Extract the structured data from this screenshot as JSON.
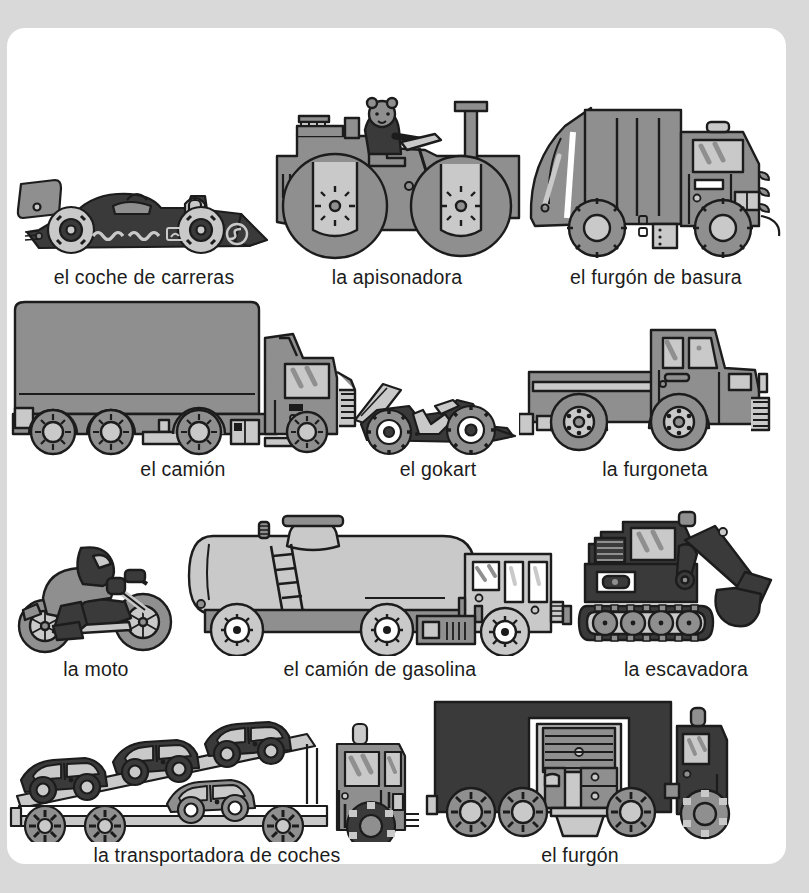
{
  "page": {
    "background_color": "#d9d9d9",
    "sheet_color": "#ffffff",
    "language": "Spanish",
    "topic": "vehiculos"
  },
  "palette": {
    "outline": "#1c1c1c",
    "dark": "#3a3a3a",
    "mid": "#8f8f8f",
    "light": "#c9c9c9",
    "pale": "#e2e2e2",
    "white": "#ffffff"
  },
  "rows": [
    {
      "items": [
        {
          "id": "race-car",
          "label": "el coche de carreras"
        },
        {
          "id": "steamroller",
          "label": "la apisonadora"
        },
        {
          "id": "garbage-truck",
          "label": "el furgón de basura"
        }
      ]
    },
    {
      "items": [
        {
          "id": "lorry",
          "label": "el camión"
        },
        {
          "id": "gokart",
          "label": "el gokart"
        },
        {
          "id": "pickup",
          "label": "la furgoneta"
        }
      ]
    },
    {
      "items": [
        {
          "id": "motorbike",
          "label": "la moto"
        },
        {
          "id": "tanker",
          "label": "el camión de gasolina"
        },
        {
          "id": "excavator",
          "label": "la escavadora"
        }
      ]
    },
    {
      "items": [
        {
          "id": "car-transporter",
          "label": "la transportadora de coches"
        },
        {
          "id": "van",
          "label": "el furgón"
        }
      ]
    }
  ]
}
